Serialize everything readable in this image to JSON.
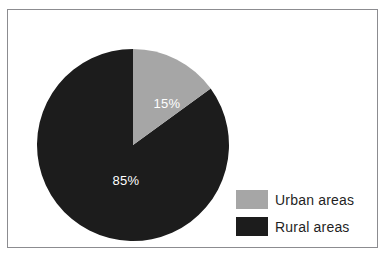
{
  "chart_data": {
    "type": "pie",
    "title": "",
    "categories": [
      "Urban areas",
      "Rural areas"
    ],
    "values": [
      15,
      85
    ],
    "unit": "%",
    "data_labels": [
      "15%",
      "85%"
    ],
    "colors": [
      "#a6a6a6",
      "#1c1c1c"
    ],
    "start_angle_deg": 0,
    "direction": "clockwise",
    "legend_position": "right",
    "grid": false,
    "xlabel": "",
    "ylabel": ""
  },
  "frame": {
    "border_color": "#8c8c90",
    "background": "#ffffff"
  },
  "slices": [
    {
      "name": "Urban areas",
      "label": "15%",
      "value": 15,
      "color": "#a6a6a6",
      "label_color": "#ffffff"
    },
    {
      "name": "Rural areas",
      "label": "85%",
      "value": 85,
      "color": "#1c1c1c",
      "label_color": "#ffffff"
    }
  ],
  "legend": {
    "items": [
      {
        "label": "Urban areas",
        "color": "#a6a6a6"
      },
      {
        "label": "Rural areas",
        "color": "#1c1c1c"
      }
    ]
  }
}
